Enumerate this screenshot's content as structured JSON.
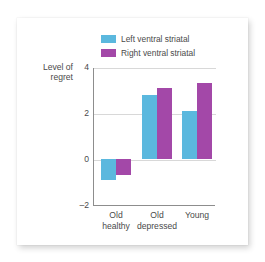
{
  "chart_data": {
    "type": "bar",
    "title": "",
    "xlabel": "",
    "ylabel": "Level of regret",
    "ylabel_line1": "Level of",
    "ylabel_line2": "regret",
    "ylim": [
      -2,
      4
    ],
    "yticks": [
      4,
      2,
      0,
      -2
    ],
    "ytick_labels": [
      "4",
      "2",
      "0",
      "–2"
    ],
    "grid": true,
    "legend_position": "top",
    "categories": [
      "Old healthy",
      "Old depressed",
      "Young"
    ],
    "category_lines": [
      [
        "Old",
        "healthy"
      ],
      [
        "Old",
        "depressed"
      ],
      [
        "Young",
        ""
      ]
    ],
    "series": [
      {
        "name": "Left ventral striatal",
        "color": "#5bb8de",
        "values": [
          -0.9,
          2.8,
          2.1
        ]
      },
      {
        "name": "Right ventral striatal",
        "color": "#a348a8",
        "values": [
          -0.7,
          3.1,
          3.3
        ]
      }
    ]
  },
  "legend": {
    "items": [
      {
        "label": "Left ventral striatal",
        "color": "#5bb8de"
      },
      {
        "label": "Right ventral striatal",
        "color": "#a348a8"
      }
    ]
  },
  "colors": {
    "series_left": "#5bb8de",
    "series_right": "#a348a8",
    "axis": "#8d8d8d",
    "gridline": "#d8d8d8",
    "text": "#4a4a4a",
    "card_background": "#ffffff",
    "page_background": "#ffffff"
  }
}
